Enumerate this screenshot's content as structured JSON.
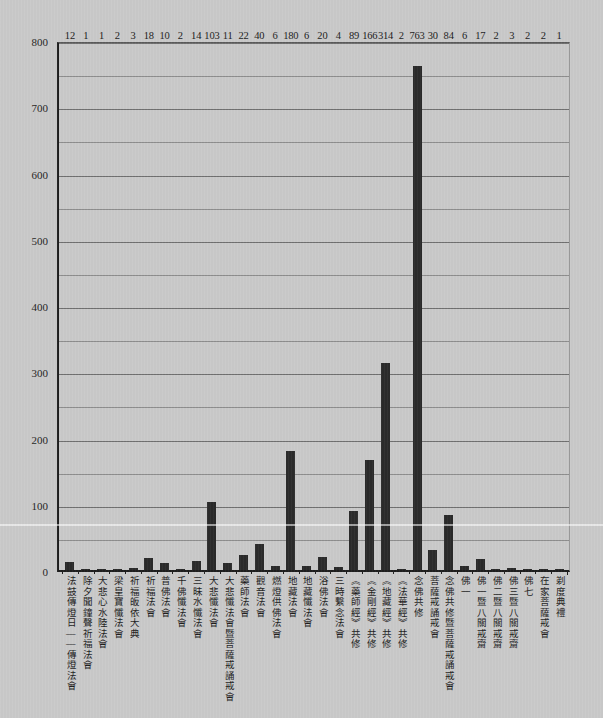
{
  "chart_data": {
    "type": "bar",
    "title": "",
    "subtitle": "",
    "xlabel": "",
    "ylabel": "",
    "ylim": [
      0,
      800
    ],
    "ytick_interval": 100,
    "gridline_interval": 50,
    "grid": true,
    "legend": "none",
    "bar_color": "#2a2a2a",
    "background_color": "#c9c9c9",
    "axis_color": "#1d1d1d",
    "yticks": [
      800,
      700,
      600,
      500,
      400,
      300,
      200,
      100,
      0
    ],
    "categories": [
      "法鼓傳燈日——傳燈法會",
      "除夕聞鐘聲祈福法會",
      "大悲心水陸法會",
      "梁皇寶懺法會",
      "祈福皈依大典",
      "祈福法會",
      "普佛法會",
      "千佛懺法會",
      "三昧水懺法會",
      "大悲懺法會",
      "大悲懺法會暨菩薩戒誦戒會",
      "藥師法會",
      "觀音法會",
      "燃燈供佛法會",
      "地藏法會",
      "地藏懺法會",
      "浴佛法會",
      "三時繫念法會",
      "《藥師經》共修",
      "《金剛經》共修",
      "《地藏經》共修",
      "《法華經》共修",
      "念佛共修",
      "菩薩戒誦戒會",
      "念佛共修暨菩薩戒誦戒會",
      "佛一",
      "佛一暨八關戒齋",
      "佛二暨八關戒齋",
      "佛三暨八關戒齋",
      "佛七",
      "在家菩薩戒會",
      "剃度典禮"
    ],
    "values": [
      12,
      1,
      1,
      2,
      3,
      18,
      10,
      2,
      14,
      103,
      11,
      22,
      40,
      6,
      180,
      6,
      20,
      4,
      89,
      166,
      314,
      2,
      763,
      30,
      84,
      6,
      17,
      2,
      3,
      2,
      2,
      1
    ]
  }
}
